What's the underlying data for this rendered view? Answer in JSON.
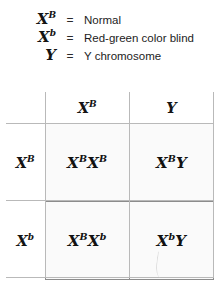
{
  "legend": {
    "rows": [
      {
        "symbol": "X",
        "superscript": "B",
        "equals": "=",
        "description": "Normal"
      },
      {
        "symbol": "X",
        "superscript": "b",
        "equals": "=",
        "description": "Red-green color blind"
      },
      {
        "symbol": "Y",
        "superscript": "",
        "equals": "=",
        "description": "Y chromosome"
      }
    ]
  },
  "punnett": {
    "corner_label": "",
    "column_headers": [
      {
        "symbol": "X",
        "superscript": "B"
      },
      {
        "symbol": "Y",
        "superscript": ""
      }
    ],
    "row_headers": [
      {
        "symbol": "X",
        "superscript": "B"
      },
      {
        "symbol": "X",
        "superscript": "b"
      }
    ],
    "cells": [
      [
        {
          "a_symbol": "X",
          "a_sup": "B",
          "b_symbol": "X",
          "b_sup": "B"
        },
        {
          "a_symbol": "X",
          "a_sup": "B",
          "b_symbol": "Y",
          "b_sup": ""
        }
      ],
      [
        {
          "a_symbol": "X",
          "a_sup": "B",
          "b_symbol": "X",
          "b_sup": "b"
        },
        {
          "a_symbol": "X",
          "a_sup": "b",
          "b_symbol": "Y",
          "b_sup": ""
        }
      ]
    ]
  },
  "colors": {
    "page_background": "#ffffff",
    "cell_background": "#fafafa",
    "grid_line": "#8c8c8c",
    "guide_line": "#b9b9b9",
    "text": "#141414"
  }
}
